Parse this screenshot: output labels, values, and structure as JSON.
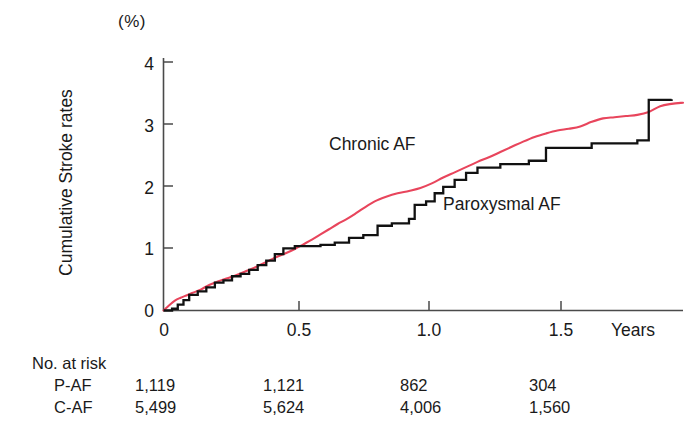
{
  "figure": {
    "unit_label": "(%)",
    "y_axis_title": "Cumulative Stroke rates",
    "x_axis_title": "Years"
  },
  "axes": {
    "y_ticks": [
      "0",
      "1",
      "2",
      "3",
      "4"
    ],
    "x_ticks": [
      "0",
      "0.5",
      "1.0",
      "1.5"
    ]
  },
  "annotations": {
    "chronic": "Chronic AF",
    "paroxysmal": "Paroxysmal AF"
  },
  "risk_table": {
    "title": "No. at risk",
    "rows": [
      {
        "label": "P-AF",
        "values": [
          "1,119",
          "1,121",
          "862",
          "304"
        ]
      },
      {
        "label": "C-AF",
        "values": [
          "5,499",
          "5,624",
          "4,006",
          "1,560"
        ]
      }
    ]
  },
  "colors": {
    "chronic_af": "#e8455c",
    "paroxysmal_af": "#111111",
    "axis": "#4a4a4a",
    "text": "#1a1a1a"
  },
  "caption_cut": "",
  "chart_data": {
    "type": "line",
    "title": "",
    "xlabel": "Years",
    "ylabel": "Cumulative Stroke rates",
    "yunit": "(%)",
    "xlim": [
      0,
      1.82
    ],
    "ylim": [
      0,
      4.35
    ],
    "xticks": [
      0,
      0.5,
      1.0,
      1.5
    ],
    "yticks": [
      0,
      1,
      2,
      3,
      4
    ],
    "grid": false,
    "legend": "in-plot annotations",
    "series": [
      {
        "name": "Chronic AF",
        "color": "#e8455c",
        "style": "smooth-step",
        "points": [
          [
            0.0,
            0.0
          ],
          [
            0.02,
            0.09
          ],
          [
            0.04,
            0.17
          ],
          [
            0.06,
            0.22
          ],
          [
            0.08,
            0.26
          ],
          [
            0.1,
            0.3
          ],
          [
            0.13,
            0.36
          ],
          [
            0.16,
            0.44
          ],
          [
            0.19,
            0.5
          ],
          [
            0.22,
            0.55
          ],
          [
            0.25,
            0.6
          ],
          [
            0.28,
            0.66
          ],
          [
            0.31,
            0.72
          ],
          [
            0.34,
            0.79
          ],
          [
            0.37,
            0.86
          ],
          [
            0.4,
            0.93
          ],
          [
            0.43,
            0.99
          ],
          [
            0.46,
            1.06
          ],
          [
            0.49,
            1.14
          ],
          [
            0.52,
            1.22
          ],
          [
            0.55,
            1.31
          ],
          [
            0.58,
            1.4
          ],
          [
            0.61,
            1.49
          ],
          [
            0.64,
            1.57
          ],
          [
            0.67,
            1.66
          ],
          [
            0.7,
            1.76
          ],
          [
            0.74,
            1.88
          ],
          [
            0.78,
            1.96
          ],
          [
            0.82,
            2.02
          ],
          [
            0.86,
            2.06
          ],
          [
            0.9,
            2.11
          ],
          [
            0.94,
            2.19
          ],
          [
            0.98,
            2.29
          ],
          [
            1.02,
            2.38
          ],
          [
            1.06,
            2.47
          ],
          [
            1.1,
            2.56
          ],
          [
            1.14,
            2.64
          ],
          [
            1.18,
            2.73
          ],
          [
            1.22,
            2.82
          ],
          [
            1.26,
            2.91
          ],
          [
            1.3,
            2.99
          ],
          [
            1.34,
            3.05
          ],
          [
            1.38,
            3.1
          ],
          [
            1.42,
            3.13
          ],
          [
            1.46,
            3.17
          ],
          [
            1.5,
            3.25
          ],
          [
            1.54,
            3.31
          ],
          [
            1.58,
            3.33
          ],
          [
            1.62,
            3.35
          ],
          [
            1.66,
            3.37
          ],
          [
            1.7,
            3.42
          ],
          [
            1.74,
            3.52
          ],
          [
            1.78,
            3.56
          ],
          [
            1.82,
            3.58
          ]
        ]
      },
      {
        "name": "Paroxysmal AF",
        "color": "#111111",
        "style": "step",
        "points": [
          [
            0.0,
            0.0
          ],
          [
            0.03,
            0.03
          ],
          [
            0.05,
            0.1
          ],
          [
            0.07,
            0.18
          ],
          [
            0.09,
            0.27
          ],
          [
            0.12,
            0.33
          ],
          [
            0.15,
            0.4
          ],
          [
            0.18,
            0.48
          ],
          [
            0.21,
            0.52
          ],
          [
            0.24,
            0.59
          ],
          [
            0.27,
            0.63
          ],
          [
            0.3,
            0.7
          ],
          [
            0.33,
            0.78
          ],
          [
            0.36,
            0.86
          ],
          [
            0.39,
            0.97
          ],
          [
            0.42,
            1.07
          ],
          [
            0.46,
            1.11
          ],
          [
            0.55,
            1.13
          ],
          [
            0.6,
            1.17
          ],
          [
            0.65,
            1.25
          ],
          [
            0.7,
            1.3
          ],
          [
            0.75,
            1.46
          ],
          [
            0.8,
            1.5
          ],
          [
            0.86,
            1.58
          ],
          [
            0.88,
            1.82
          ],
          [
            0.92,
            1.88
          ],
          [
            0.95,
            2.02
          ],
          [
            0.98,
            2.13
          ],
          [
            1.02,
            2.25
          ],
          [
            1.06,
            2.37
          ],
          [
            1.1,
            2.46
          ],
          [
            1.18,
            2.52
          ],
          [
            1.28,
            2.58
          ],
          [
            1.34,
            2.8
          ],
          [
            1.5,
            2.88
          ],
          [
            1.66,
            2.93
          ],
          [
            1.7,
            3.63
          ],
          [
            1.78,
            3.64
          ]
        ]
      }
    ],
    "at_risk": {
      "times": [
        0,
        0.5,
        1.0,
        1.5
      ],
      "rows": [
        {
          "label": "P-AF",
          "counts": [
            1119,
            1121,
            862,
            304
          ]
        },
        {
          "label": "C-AF",
          "counts": [
            5499,
            5624,
            4006,
            1560
          ]
        }
      ]
    }
  }
}
